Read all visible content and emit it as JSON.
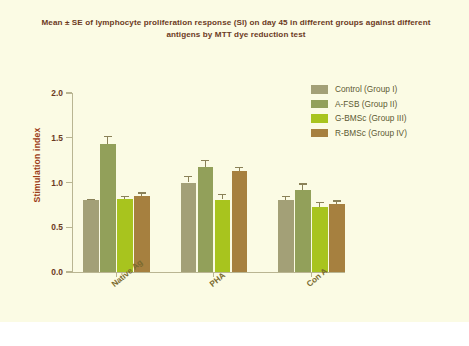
{
  "figure": {
    "title": "Mean ± SE  of lymphocyte proliferation response (SI) on day 45 in different groups against different antigens by MTT dye reduction test",
    "background_color": "#fbfbe4",
    "title_color": "#6b3a1e"
  },
  "chart_data": {
    "type": "bar",
    "title": "Mean ± SE  of lymphocyte proliferation response (SI) on day 45 in different groups against different antigens by MTT dye reduction test",
    "xlabel": "",
    "ylabel": "Stimulation index",
    "categories": [
      "Native Ag",
      "PHA",
      "Con A"
    ],
    "ylim": [
      0.0,
      2.0
    ],
    "yticks": [
      0.0,
      0.5,
      1.0,
      1.5,
      2.0
    ],
    "ytick_labels": [
      "0.0",
      "0.5",
      "1.0",
      "1.5",
      "2.0"
    ],
    "grid": false,
    "legend_position": "upper right",
    "error_type": "SE",
    "series": [
      {
        "name": "Control (Group I)",
        "color": "#a3a077",
        "texture": "solid",
        "values": [
          0.8,
          1.0,
          0.8
        ],
        "errors": [
          0.02,
          0.07,
          0.05
        ]
      },
      {
        "name": "A-FSB  (Group II)",
        "color": "#92a05a",
        "texture": "checker",
        "values": [
          1.43,
          1.17,
          0.92
        ],
        "errors": [
          0.09,
          0.08,
          0.07
        ]
      },
      {
        "name": "G-BMSc (Group III)",
        "color": "#a8c41e",
        "texture": "solid",
        "values": [
          0.82,
          0.81,
          0.73
        ],
        "errors": [
          0.03,
          0.06,
          0.05
        ]
      },
      {
        "name": "R-BMSc  (Group IV)",
        "color": "#a6803f",
        "texture": "solid",
        "values": [
          0.85,
          1.13,
          0.76
        ],
        "errors": [
          0.04,
          0.04,
          0.04
        ]
      }
    ]
  },
  "legend": {
    "items": [
      {
        "label": "Control (Group I)",
        "color": "#a3a077",
        "texture": "solid"
      },
      {
        "label": "A-FSB  (Group II)",
        "color": "#92a05a",
        "texture": "checker"
      },
      {
        "label": "G-BMSc (Group III)",
        "color": "#a8c41e",
        "texture": "solid"
      },
      {
        "label": "R-BMSc  (Group IV)",
        "color": "#a6803f",
        "texture": "solid"
      }
    ]
  },
  "axes": {
    "y_title": "Stimulation index",
    "y_title_color": "#9c3b16",
    "tick_color": "#6b3a1e",
    "category_label_color": "#7a6a2e"
  }
}
